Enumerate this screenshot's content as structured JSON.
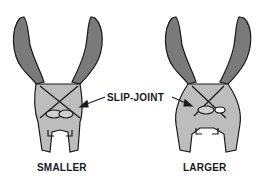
{
  "diagram": {
    "callout_label": "SLIP-JOINT",
    "panels": [
      {
        "caption": "SMALLER"
      },
      {
        "caption": "LARGER"
      }
    ],
    "colors": {
      "handle": "#7a7a7a",
      "jaw": "#bdbdbd",
      "outline": "#1a1a1a",
      "background": "#ffffff"
    }
  }
}
